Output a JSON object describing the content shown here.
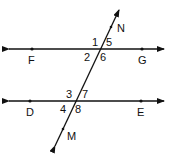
{
  "diagram": {
    "lines": {
      "top": {
        "label_left": "F",
        "label_right": "G"
      },
      "bottom": {
        "label_left": "D",
        "label_right": "E"
      },
      "transversal": {
        "label_top": "N",
        "label_bottom": "M"
      }
    },
    "angles": {
      "a1": "1",
      "a2": "2",
      "a5": "5",
      "a6": "6",
      "a3": "3",
      "a4": "4",
      "a7": "7",
      "a8": "8"
    },
    "colors": {
      "stroke": "#111111",
      "background": "#ffffff"
    }
  }
}
